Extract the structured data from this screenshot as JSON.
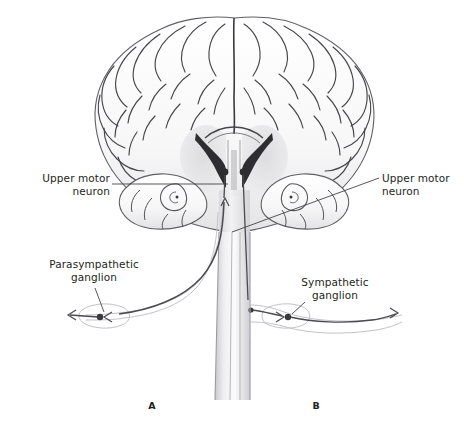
{
  "figure": {
    "background_color": "#ffffff",
    "ink_color": "#231f20",
    "line_color": "#6e6e72"
  },
  "labels": {
    "upper_motor_neuron_left": "Upper motor\nneuron",
    "upper_motor_neuron_left_line1": "Upper motor",
    "upper_motor_neuron_left_line2": "neuron",
    "upper_motor_neuron_right_line1": "Upper motor",
    "upper_motor_neuron_right_line2": "neuron",
    "parasympathetic_ganglion_line1": "Parasympathetic",
    "parasympathetic_ganglion_line2": "ganglion",
    "sympathetic_ganglion_line1": "Sympathetic",
    "sympathetic_ganglion_line2": "ganglion"
  },
  "panels": {
    "left": "A",
    "right": "B"
  },
  "anatomy": {
    "brain": "coronal-hemisection-cerebrum",
    "ventricles": "lateral-ventricles",
    "temporal_lobes": "temporal-lobe-hippocampus",
    "spinal_cord": "descending-spinal-cord",
    "neuron_soma_left": "upper-motor-neuron-soma-left",
    "neuron_soma_right": "upper-motor-neuron-soma-right",
    "parasympathetic_ganglion": "parasympathetic-ganglion-node",
    "sympathetic_ganglion": "sympathetic-ganglion-node"
  }
}
